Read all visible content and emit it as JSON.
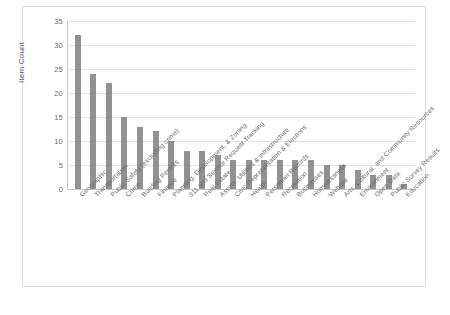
{
  "chart_data": {
    "type": "bar",
    "title": "",
    "xlabel": "",
    "ylabel": "Item Count",
    "ylim": [
      0,
      35
    ],
    "yticks": [
      0,
      5,
      10,
      15,
      20,
      25,
      30,
      35
    ],
    "grid": true,
    "legend": "none",
    "bar_color": "#7a7a7a",
    "categories": [
      "Geographic",
      "Transportation",
      "Public Safety (excluding crime)",
      "Crime",
      "Building Permits",
      "Finance",
      "Planning, Development, & Zoning",
      "311 and Service Request Tracking",
      "Real Estate",
      "Assets, Utilities & Infrastructure",
      "Civic Representation & Elections",
      "Health",
      "Personnel Records",
      "Recreation",
      "Businesses",
      "Homelessness",
      "Website",
      "Arts, Cultural, and Community Resources",
      "Environment",
      "Open Data",
      "Public Survey Results",
      "Education"
    ],
    "values": [
      32,
      24,
      22,
      15,
      13,
      12,
      10,
      8,
      8,
      7,
      6,
      6,
      6,
      6,
      6,
      6,
      5,
      5,
      4,
      3,
      3,
      1
    ]
  }
}
